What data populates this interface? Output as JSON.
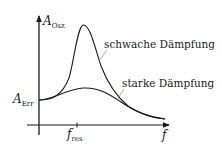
{
  "diagram": {
    "type": "resonance-curve",
    "colors": {
      "line": "#1a1a1a",
      "background": "#ffffff"
    },
    "axes": {
      "y": {
        "symbol": "A",
        "subscript": "Osz"
      },
      "x": {
        "symbol": "f"
      }
    },
    "markers": {
      "excitation_amplitude": {
        "symbol": "A",
        "subscript": "Err"
      },
      "resonance_frequency": {
        "symbol": "f",
        "subscript": "res"
      }
    },
    "curves": [
      {
        "id": "weak",
        "label": "schwache Dämpfung"
      },
      {
        "id": "strong",
        "label": "starke Dämpfung"
      }
    ]
  }
}
